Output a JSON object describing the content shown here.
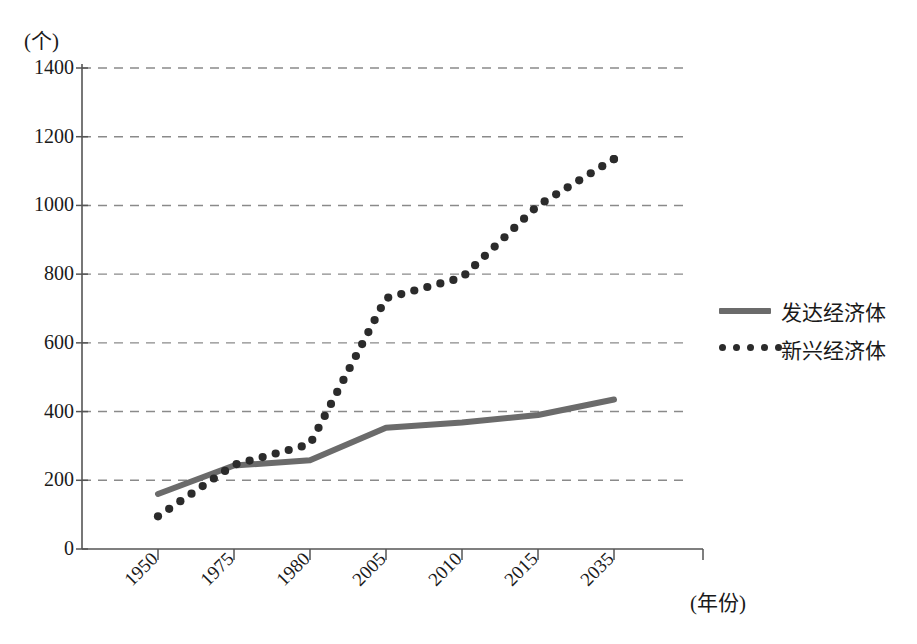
{
  "chart_data": {
    "type": "line",
    "title": "",
    "unit_label": "(个)",
    "xlabel": "(年份)",
    "ylabel": "",
    "grid": true,
    "legend_position": "right",
    "categories": [
      "1950",
      "1975",
      "1980",
      "2005",
      "2010",
      "2015",
      "2035"
    ],
    "x_tick_labels": [
      "1950",
      "1975",
      "1980",
      "2005",
      "2010",
      "2015",
      "2035"
    ],
    "y_tick_labels": [
      "0",
      "200",
      "400",
      "600",
      "800",
      "1000",
      "1200",
      "1400"
    ],
    "y_ticks": [
      0,
      200,
      400,
      600,
      800,
      1000,
      1200,
      1400
    ],
    "ylim": [
      0,
      1400
    ],
    "series": [
      {
        "name": "发达经济体",
        "style": "solid",
        "color": "#6b6b6b",
        "values": [
          160,
          243,
          258,
          353,
          368,
          390,
          435
        ]
      },
      {
        "name": "新兴经济体",
        "style": "dotted",
        "color": "#2b2b2b",
        "values": [
          95,
          245,
          305,
          730,
          790,
          1000,
          1135
        ]
      }
    ],
    "legend": [
      {
        "label": "发达经济体",
        "style": "solid",
        "color": "#6b6b6b"
      },
      {
        "label": "新兴经济体",
        "style": "dotted",
        "color": "#2b2b2b"
      }
    ]
  }
}
